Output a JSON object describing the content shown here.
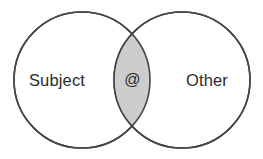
{
  "diagram": {
    "type": "venn",
    "title": "",
    "background_color": "#ffffff",
    "stroke_color": "#464646",
    "intersection_fill": "#cdcdcd",
    "circle_fill": "#ffffff",
    "text_color": "#2b2b2b",
    "sets": [
      {
        "id": "left",
        "label": "Subject",
        "center_x": 82,
        "center_y": 80,
        "radius": 68
      },
      {
        "id": "right",
        "label": "Other",
        "center_x": 182,
        "center_y": 80,
        "radius": 68
      }
    ],
    "intersection": {
      "label": "@",
      "center_x": 133,
      "center_y": 80
    }
  }
}
